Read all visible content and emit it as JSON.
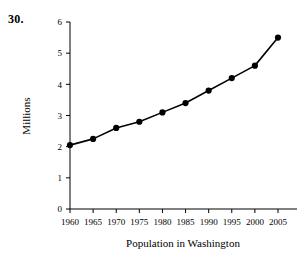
{
  "problem": {
    "number": "30."
  },
  "chart_data": {
    "type": "line",
    "title": "",
    "xlabel": "Population in Washington",
    "ylabel": "Millions",
    "categories": [
      "1960",
      "1965",
      "1970",
      "1975",
      "1980",
      "1985",
      "1990",
      "1995",
      "2000",
      "2005"
    ],
    "x": [
      1960,
      1965,
      1970,
      1975,
      1980,
      1985,
      1990,
      1995,
      2000,
      2005
    ],
    "values": [
      2.05,
      2.25,
      2.6,
      2.8,
      3.1,
      3.4,
      3.8,
      4.2,
      4.6,
      5.5
    ],
    "series": [
      {
        "name": "Population in Washington",
        "values": [
          2.05,
          2.25,
          2.6,
          2.8,
          3.1,
          3.4,
          3.8,
          4.2,
          4.6,
          5.5
        ]
      }
    ],
    "ylim": [
      0,
      6
    ],
    "yticks": [
      0,
      1,
      2,
      3,
      4,
      5,
      6
    ],
    "ytick_labels": [
      "0",
      "1",
      "2",
      "3",
      "4",
      "5",
      "6"
    ],
    "xlim": [
      1957.5,
      2007.5
    ],
    "xticks": [
      1960,
      1965,
      1970,
      1975,
      1980,
      1985,
      1990,
      1995,
      2000,
      2005
    ],
    "xtick_labels": [
      "1960",
      "1965",
      "1970",
      "1975",
      "1980",
      "1985",
      "1990",
      "1995",
      "2000",
      "2005"
    ],
    "grid": false,
    "legend": "none",
    "marker": "filled-circle",
    "line_color": "#000000",
    "marker_color": "#000000",
    "background_color": "#ffffff"
  }
}
